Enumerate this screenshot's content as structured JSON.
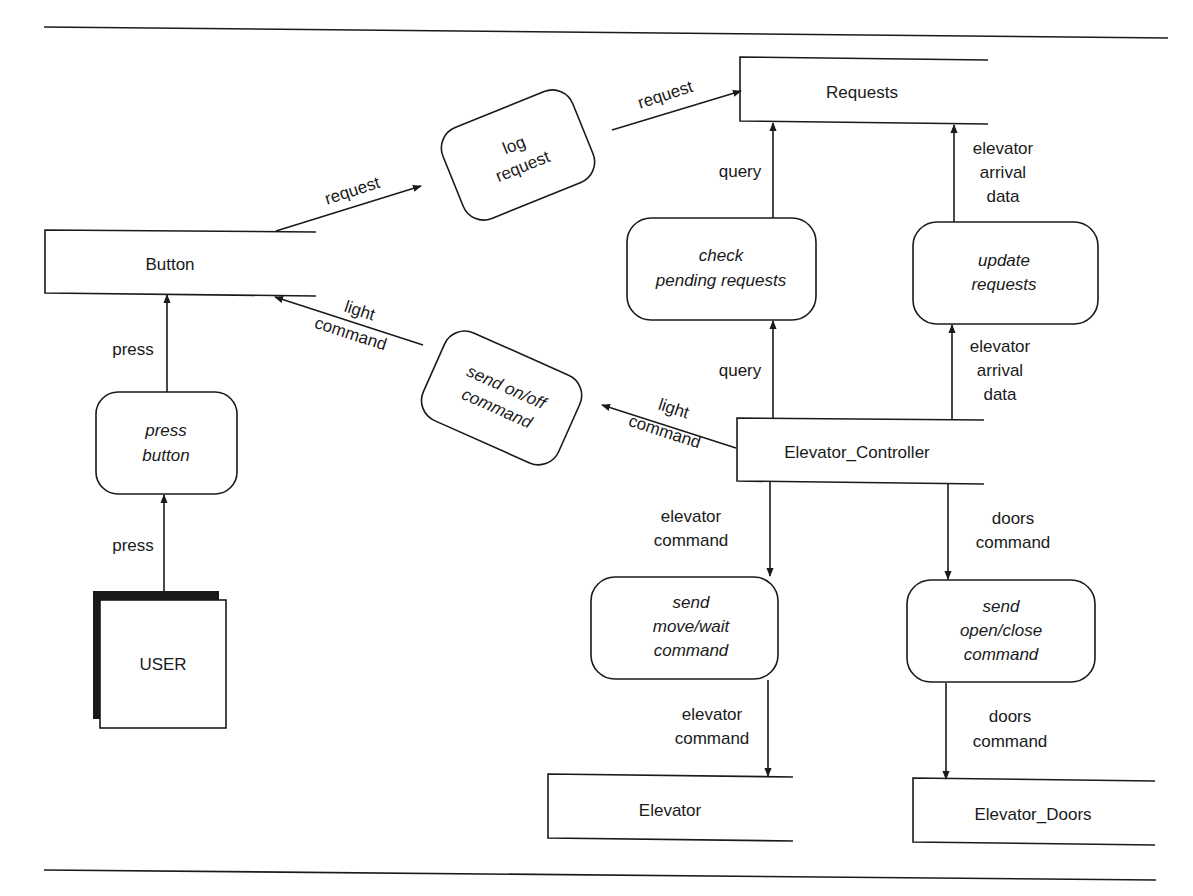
{
  "diagram": {
    "type": "data-flow-diagram",
    "colors": {
      "ink": "#1a1a1a",
      "background": "#ffffff"
    },
    "terminators": [
      {
        "id": "user",
        "label": "USER"
      }
    ],
    "data_stores": [
      {
        "id": "button",
        "label": "Button"
      },
      {
        "id": "requests",
        "label": "Requests"
      },
      {
        "id": "elevator_controller",
        "label": "Elevator_Controller"
      },
      {
        "id": "elevator",
        "label": "Elevator"
      },
      {
        "id": "elevator_doors",
        "label": "Elevator_Doors"
      }
    ],
    "processes": [
      {
        "id": "press_button",
        "lines": [
          "press",
          "button"
        ]
      },
      {
        "id": "log_request",
        "lines": [
          "log",
          "request"
        ]
      },
      {
        "id": "send_onoff",
        "lines": [
          "send on/off",
          "command"
        ]
      },
      {
        "id": "check_pending",
        "lines": [
          "check",
          "pending requests"
        ]
      },
      {
        "id": "update_requests",
        "lines": [
          "update",
          "requests"
        ]
      },
      {
        "id": "send_movewait",
        "lines": [
          "send",
          "move/wait",
          "command"
        ]
      },
      {
        "id": "send_openclose",
        "lines": [
          "send",
          "open/close",
          "command"
        ]
      }
    ],
    "flows": [
      {
        "from": "user",
        "to": "press_button",
        "lines": [
          "press"
        ]
      },
      {
        "from": "press_button",
        "to": "button",
        "lines": [
          "press"
        ]
      },
      {
        "from": "button",
        "to": "log_request",
        "lines": [
          "request"
        ]
      },
      {
        "from": "log_request",
        "to": "requests",
        "lines": [
          "request"
        ]
      },
      {
        "from": "send_onoff",
        "to": "button",
        "lines": [
          "light",
          "command"
        ]
      },
      {
        "from": "elevator_controller",
        "to": "send_onoff",
        "lines": [
          "light",
          "command"
        ]
      },
      {
        "from": "check_pending",
        "to": "requests",
        "lines": [
          "query"
        ]
      },
      {
        "from": "elevator_controller",
        "to": "check_pending",
        "lines": [
          "query"
        ]
      },
      {
        "from": "update_requests",
        "to": "requests",
        "lines": [
          "elevator",
          "arrival",
          "data"
        ]
      },
      {
        "from": "elevator_controller",
        "to": "update_requests",
        "lines": [
          "elevator",
          "arrival",
          "data"
        ]
      },
      {
        "from": "elevator_controller",
        "to": "send_movewait",
        "lines": [
          "elevator",
          "command"
        ]
      },
      {
        "from": "send_movewait",
        "to": "elevator",
        "lines": [
          "elevator",
          "command"
        ]
      },
      {
        "from": "elevator_controller",
        "to": "send_openclose",
        "lines": [
          "doors",
          "command"
        ]
      },
      {
        "from": "send_openclose",
        "to": "elevator_doors",
        "lines": [
          "doors",
          "command"
        ]
      }
    ]
  }
}
